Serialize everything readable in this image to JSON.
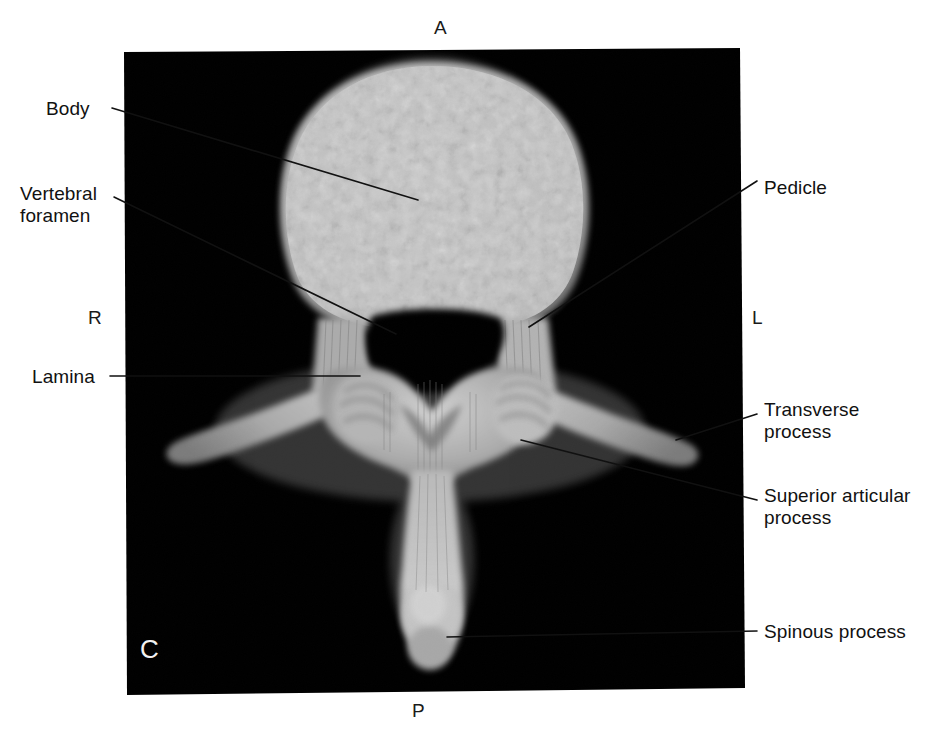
{
  "figure": {
    "panel_letter": "C",
    "modality": "3D volume-rendered CT of a lumbar vertebra, superior (axial) view",
    "background_color": "#ffffff",
    "panel_color": "#000000",
    "bone_color": "#b9b9b9",
    "label_color": "#111111",
    "panel_letter_color": "#f2f2f2"
  },
  "orientation": {
    "anterior": "A",
    "posterior": "P",
    "right": "R",
    "left": "L"
  },
  "labels": {
    "body": "Body",
    "vertebral_foramen": "Vertebral\nforamen",
    "lamina": "Lamina",
    "pedicle": "Pedicle",
    "transverse_process": "Transverse\nprocess",
    "superior_articular_process": "Superior articular\nprocess",
    "spinous_process": "Spinous process"
  },
  "callouts": [
    {
      "name": "body",
      "side": "left",
      "text": "Body"
    },
    {
      "name": "vertebral-foramen",
      "side": "left",
      "text": "Vertebral foramen"
    },
    {
      "name": "lamina",
      "side": "left",
      "text": "Lamina"
    },
    {
      "name": "pedicle",
      "side": "right",
      "text": "Pedicle"
    },
    {
      "name": "transverse-process",
      "side": "right",
      "text": "Transverse process"
    },
    {
      "name": "superior-articular-process",
      "side": "right",
      "text": "Superior articular process"
    },
    {
      "name": "spinous-process",
      "side": "right",
      "text": "Spinous process"
    }
  ]
}
